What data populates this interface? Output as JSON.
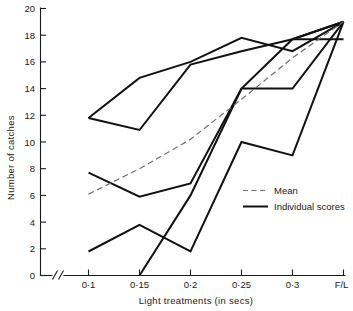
{
  "chart_data": {
    "type": "line",
    "title": "",
    "xlabel": "Light  treatments (in secs)",
    "ylabel": "Number of catches",
    "categories": [
      "0·1",
      "0·15",
      "0·2",
      "0·25",
      "0·3",
      "F/L"
    ],
    "x_tick_labels": [
      "0·1",
      "0·15",
      "0·2",
      "0·25",
      "0·3",
      "F/L"
    ],
    "y_tick_labels": [
      "0",
      "2",
      "4",
      "6",
      "8",
      "10",
      "12",
      "14",
      "16",
      "18",
      "20"
    ],
    "y_ticks": [
      0,
      2,
      4,
      6,
      8,
      10,
      12,
      14,
      16,
      18,
      20
    ],
    "ylim": [
      0,
      20
    ],
    "grid": false,
    "axis_break": "//",
    "legend_position": "center-right",
    "legend": [
      {
        "name": "Mean",
        "style": "dashed",
        "color": "#6e6e6e"
      },
      {
        "name": "Individual scores",
        "style": "solid",
        "color": "#111111"
      }
    ],
    "series": [
      {
        "name": "Mean",
        "style": "dashed",
        "values": [
          6.1,
          8.0,
          10.2,
          13.2,
          16.3,
          19.0
        ]
      },
      {
        "name": "Individual score 1",
        "style": "solid",
        "values": [
          11.8,
          14.8,
          16.0,
          17.8,
          16.8,
          19.0
        ]
      },
      {
        "name": "Individual score 2",
        "style": "solid",
        "values": [
          11.8,
          10.9,
          15.8,
          16.8,
          17.7,
          19.0
        ]
      },
      {
        "name": "Individual score 3",
        "style": "solid",
        "values": [
          7.7,
          5.9,
          6.9,
          14.0,
          14.0,
          19.0
        ]
      },
      {
        "name": "Individual score 4",
        "style": "solid",
        "values": [
          1.8,
          3.8,
          1.8,
          10.0,
          9.0,
          19.0
        ]
      },
      {
        "name": "Individual score 5",
        "style": "solid",
        "values": [
          null,
          0.0,
          6.0,
          14.0,
          17.7,
          19.0
        ]
      }
    ],
    "horizontal_reference_segment": {
      "value": 17.7,
      "from": "0·3",
      "to": "F/L"
    }
  },
  "axes": {
    "y_axis_title": "Number of catches",
    "x_axis_title": "Light  treatments (in secs)"
  }
}
